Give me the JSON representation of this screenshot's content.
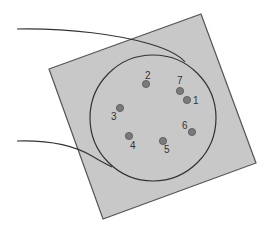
{
  "diagram": {
    "colors": {
      "square_fill": "#c8c8c8",
      "square_stroke": "#555555",
      "circle_stroke": "#333333",
      "dot_fill": "#7a7a7a",
      "dot_stroke": "#555555",
      "label": "#333333"
    },
    "points": [
      {
        "id": "1",
        "label": "1",
        "x": 187,
        "y": 100,
        "lx": 193,
        "ly": 104
      },
      {
        "id": "2",
        "label": "2",
        "x": 146,
        "y": 84,
        "lx": 145,
        "ly": 79
      },
      {
        "id": "3",
        "label": "3",
        "x": 120,
        "y": 108,
        "lx": 111,
        "ly": 120
      },
      {
        "id": "4",
        "label": "4",
        "x": 129,
        "y": 136,
        "lx": 130,
        "ly": 149
      },
      {
        "id": "5",
        "label": "5",
        "x": 163,
        "y": 141,
        "lx": 164,
        "ly": 153
      },
      {
        "id": "6",
        "label": "6",
        "x": 192,
        "y": 132,
        "lx": 182,
        "ly": 129
      },
      {
        "id": "7",
        "label": "7",
        "x": 180,
        "y": 91,
        "lx": 177,
        "ly": 84
      }
    ]
  }
}
